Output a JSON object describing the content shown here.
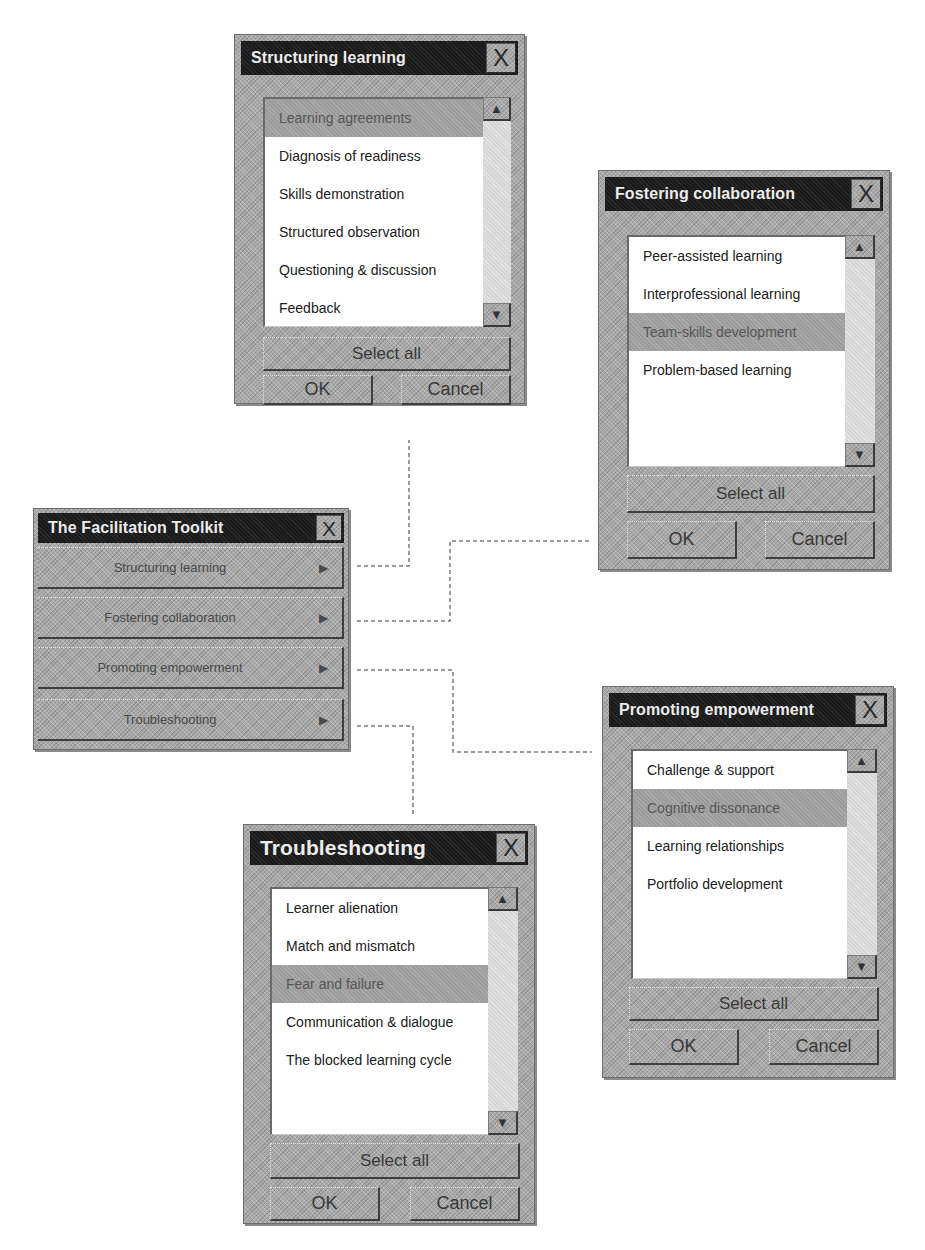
{
  "main_window": {
    "title": "The Facilitation Toolkit",
    "close_icon": "X",
    "submenu_arrow": "▶",
    "items": [
      {
        "label": "Structuring learning"
      },
      {
        "label": "Fostering  collaboration"
      },
      {
        "label": "Promoting empowerment"
      },
      {
        "label": "Troubleshooting"
      }
    ]
  },
  "dialogs": {
    "structuring": {
      "title": "Structuring learning",
      "close_icon": "X",
      "items": [
        {
          "label": "Learning agreements",
          "selected": true
        },
        {
          "label": "Diagnosis of readiness",
          "selected": false
        },
        {
          "label": "Skills demonstration",
          "selected": false
        },
        {
          "label": "Structured observation",
          "selected": false
        },
        {
          "label": "Questioning & discussion",
          "selected": false
        },
        {
          "label": "Feedback",
          "selected": false
        }
      ],
      "select_all": "Select all",
      "ok": "OK",
      "cancel": "Cancel"
    },
    "fostering": {
      "title": "Fostering collaboration",
      "close_icon": "X",
      "items": [
        {
          "label": "Peer-assisted learning",
          "selected": false
        },
        {
          "label": "Interprofessional learning",
          "selected": false
        },
        {
          "label": "Team-skills development",
          "selected": true
        },
        {
          "label": "Problem-based learning",
          "selected": false
        }
      ],
      "select_all": "Select all",
      "ok": "OK",
      "cancel": "Cancel"
    },
    "promoting": {
      "title": "Promoting empowerment",
      "close_icon": "X",
      "items": [
        {
          "label": "Challenge & support",
          "selected": false
        },
        {
          "label": "Cognitive dissonance",
          "selected": true
        },
        {
          "label": "Learning relationships",
          "selected": false
        },
        {
          "label": "Portfolio development",
          "selected": false
        }
      ],
      "select_all": "Select all",
      "ok": "OK",
      "cancel": "Cancel"
    },
    "troubleshooting": {
      "title": "Troubleshooting",
      "close_icon": "X",
      "items": [
        {
          "label": "Learner alienation",
          "selected": false
        },
        {
          "label": "Match and mismatch",
          "selected": false
        },
        {
          "label": "Fear and failure",
          "selected": true
        },
        {
          "label": "Communication & dialogue",
          "selected": false
        },
        {
          "label": "The blocked learning cycle",
          "selected": false
        }
      ],
      "select_all": "Select all",
      "ok": "OK",
      "cancel": "Cancel"
    }
  },
  "scroll_icons": {
    "up": "▲",
    "down": "▼"
  },
  "colors": {
    "titlebar": "#1a1a1a",
    "window_gray": "#a9a9a9",
    "list_bg": "#ffffff",
    "selected_row": "#9c9c9c",
    "connector": "#777777"
  }
}
